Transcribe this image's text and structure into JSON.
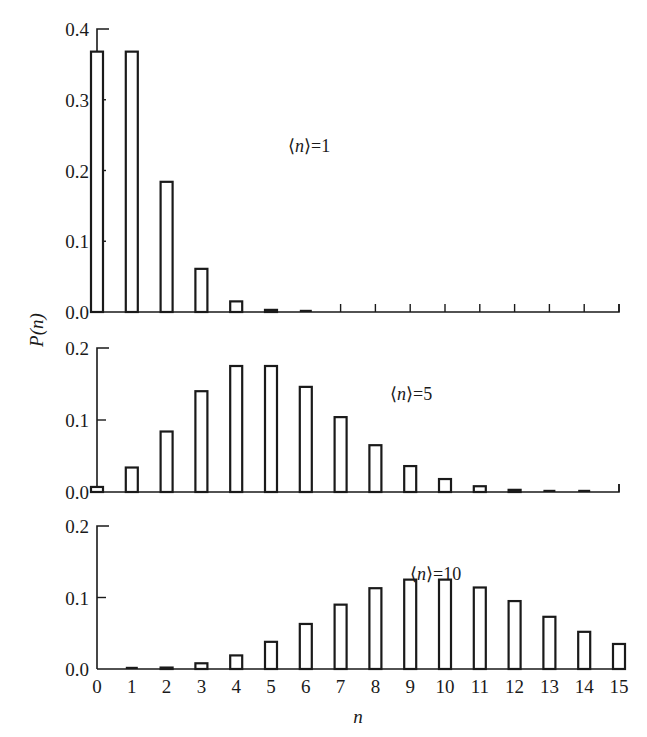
{
  "chart_data": {
    "type": "bar",
    "title": "",
    "xlabel": "n",
    "ylabel": "P(n)",
    "x": [
      0,
      1,
      2,
      3,
      4,
      5,
      6,
      7,
      8,
      9,
      10,
      11,
      12,
      13,
      14,
      15
    ],
    "x_tick_labels": [
      "0",
      "1",
      "2",
      "3",
      "4",
      "5",
      "6",
      "7",
      "8",
      "9",
      "10",
      "11",
      "12",
      "13",
      "14",
      "15"
    ],
    "grid": false,
    "legend": null,
    "panels": [
      {
        "annotation": "⟨n⟩=1",
        "mean": 1,
        "ylim": [
          0,
          0.4
        ],
        "y_ticks": [
          0.0,
          0.1,
          0.2,
          0.3,
          0.4
        ],
        "y_tick_labels": [
          "0.0",
          "0.1",
          "0.2",
          "0.3",
          "0.4"
        ],
        "values": [
          0.368,
          0.368,
          0.184,
          0.061,
          0.015,
          0.003,
          0.0005,
          0.0001,
          0,
          0,
          0,
          0,
          0,
          0,
          0,
          0
        ]
      },
      {
        "annotation": "⟨n⟩=5",
        "mean": 5,
        "ylim": [
          0,
          0.2
        ],
        "y_ticks": [
          0.0,
          0.1,
          0.2
        ],
        "y_tick_labels": [
          "0.0",
          "0.1",
          "0.2"
        ],
        "values": [
          0.007,
          0.034,
          0.084,
          0.14,
          0.175,
          0.175,
          0.146,
          0.104,
          0.065,
          0.036,
          0.018,
          0.008,
          0.003,
          0.001,
          0.0005,
          0.0002
        ]
      },
      {
        "annotation": "⟨n⟩=10",
        "mean": 10,
        "ylim": [
          0,
          0.2
        ],
        "y_ticks": [
          0.0,
          0.1,
          0.2
        ],
        "y_tick_labels": [
          "0.0",
          "0.1",
          "0.2"
        ],
        "values": [
          5e-05,
          0.0005,
          0.002,
          0.008,
          0.019,
          0.038,
          0.063,
          0.09,
          0.113,
          0.125,
          0.125,
          0.114,
          0.095,
          0.073,
          0.052,
          0.035
        ]
      }
    ]
  },
  "labels": {
    "ylabel": "P(n)",
    "xlabel": "n"
  }
}
